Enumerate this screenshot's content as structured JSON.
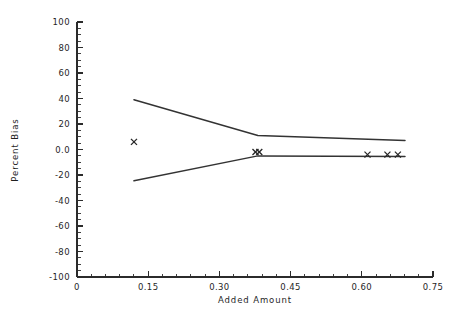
{
  "chart_data": {
    "type": "scatter",
    "title": "",
    "xlabel": "Added Amount",
    "ylabel": "Percent Bias",
    "xlim": [
      0,
      0.75
    ],
    "ylim": [
      -100,
      100
    ],
    "grid": false,
    "legend": "none",
    "x_ticks": [
      0,
      0.15,
      0.3,
      0.45,
      0.6,
      0.75
    ],
    "x_tick_labels": [
      "0",
      "0.15",
      "0.30",
      "0.45",
      "0.60",
      "0.75"
    ],
    "x_minor_tick_step": 0.03,
    "y_ticks": [
      -100,
      -80,
      -60,
      -40,
      -20,
      0,
      20,
      40,
      60,
      80,
      100
    ],
    "y_tick_labels": [
      "-100",
      "-80",
      "-60",
      "-40",
      "-20",
      "0.0",
      "20",
      "40",
      "60",
      "80",
      "100"
    ],
    "y_minor_tick_step": 5,
    "series": [
      {
        "name": "upper-bound",
        "type": "line",
        "marker": "none",
        "x": [
          0.12,
          0.381,
          0.691
        ],
        "values": [
          39.0,
          11.0,
          7.0
        ]
      },
      {
        "name": "lower-bound",
        "type": "line",
        "marker": "none",
        "x": [
          0.12,
          0.381,
          0.691
        ],
        "values": [
          -24.5,
          -5.0,
          -5.5
        ]
      },
      {
        "name": "observed-bias",
        "type": "scatter",
        "marker": "x",
        "x": [
          0.12,
          0.376,
          0.384,
          0.612,
          0.654,
          0.676
        ],
        "values": [
          6.0,
          -2.0,
          -2.0,
          -4.0,
          -4.0,
          -4.0
        ]
      }
    ]
  }
}
